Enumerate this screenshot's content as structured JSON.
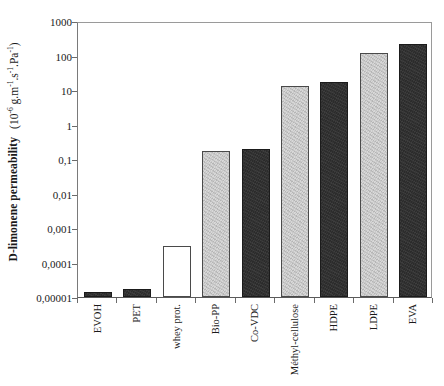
{
  "chart_data": {
    "type": "bar",
    "title": "",
    "xlabel": "",
    "ylabel": "D-limonene permeability",
    "ylabel_units": "(10-6 g.m-1.s-1.Pa-1)",
    "ylabel_parts": {
      "main": "D-limonene permeability",
      "units_prefix": "(10",
      "units_exp1": "-6",
      "units_mid1": " g.m",
      "units_exp2": "-1",
      "units_mid2": ".s",
      "units_exp3": "-1",
      "units_mid3": ".Pa",
      "units_exp4": "-1",
      "units_suffix": ")"
    },
    "yscale": "log",
    "ylim": [
      1e-05,
      1000
    ],
    "ytick_labels": [
      "1000",
      "100",
      "10",
      "1",
      "0,1",
      "0,01",
      "0,001",
      "0,0001",
      "0,00001"
    ],
    "ytick_values": [
      1000,
      100,
      10,
      1,
      0.1,
      0.01,
      0.001,
      0.0001,
      1e-05
    ],
    "grid": false,
    "legend": "none",
    "decimal_separator": ",",
    "categories": [
      "EVOH",
      "PET",
      "whey prot.",
      "Bio-PP",
      "Co-VDC",
      "Méthyl-cellulose",
      "HDPE",
      "LDPE",
      "EVA"
    ],
    "values": [
      1.4e-05,
      1.7e-05,
      0.0003,
      0.17,
      0.19,
      13,
      17,
      120,
      220
    ],
    "bar_styles": [
      "dark",
      "dark",
      "white",
      "light",
      "dark",
      "light",
      "dark",
      "light",
      "dark"
    ],
    "colors": {
      "dark_fill": "#2b2b2b",
      "light_fill": "#d8d8d8",
      "white_fill": "#ffffff",
      "bar_edge": "#4a4a4a",
      "axis": "#6b6b6b",
      "text": "#1a1a1a"
    }
  }
}
